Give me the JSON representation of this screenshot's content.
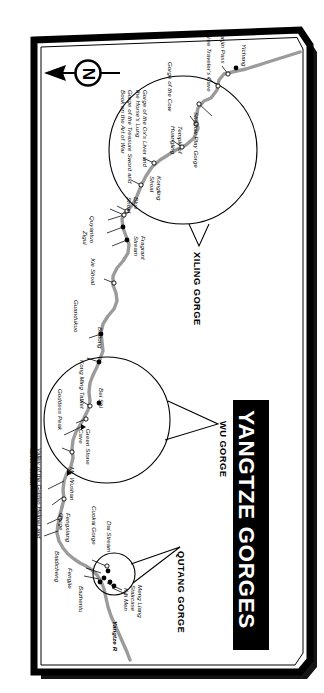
{
  "map": {
    "title": "YANGTZE GORGES",
    "river_label": "Yangtze R",
    "compass_label": "N",
    "colors": {
      "river": "#9b9b9b",
      "border": "#000000",
      "shadow": "#1a1a1a",
      "paper": "#ffffff",
      "banner": "#000000",
      "banner_text": "#ffffff"
    },
    "gorge_sections": [
      {
        "name": "XILING GORGE",
        "x": 196,
        "y": 240
      },
      {
        "name": "WU GORGE",
        "x": 222,
        "y": 412
      },
      {
        "name": "QUTANG GORGE",
        "x": 180,
        "y": 540
      }
    ],
    "places": [
      {
        "label": "Yichang",
        "marker": "filled"
      },
      {
        "label": "Nanjin Pass",
        "marker": "open"
      },
      {
        "label": "Three Traveler's Cave",
        "marker": "open"
      },
      {
        "label": "Shadow Play Gorge",
        "marker": "open"
      },
      {
        "label": "Gorge of the Cow",
        "marker": "open"
      },
      {
        "label": "Temple of Huangling",
        "marker": "open"
      },
      {
        "label": "Gorge of the Ox's Liver and the Horse's Lung",
        "marker": "open"
      },
      {
        "label": "Gorge of the Treasure Sword and Book on the Art of War",
        "marker": "open"
      },
      {
        "label": "Kongling Shoal",
        "marker": "open"
      },
      {
        "label": "Blue Shoal",
        "marker": "open"
      },
      {
        "label": "Fragrant Stream",
        "marker": "open"
      },
      {
        "label": "Quyantuo",
        "marker": "filled"
      },
      {
        "label": "Zigui",
        "marker": "filled"
      },
      {
        "label": "Xie Shoal",
        "marker": "open"
      },
      {
        "label": "Guandukuo",
        "marker": "filled"
      },
      {
        "label": "Badong",
        "marker": "filled"
      },
      {
        "label": "Kong Ming Tablet",
        "marker": "open"
      },
      {
        "label": "Bei Shi",
        "marker": "filled"
      },
      {
        "label": "Goddess Peak",
        "marker": "peak"
      },
      {
        "label": "Green Stone Cave",
        "marker": "open"
      },
      {
        "label": "Mt. Wushan",
        "marker": "peak"
      },
      {
        "label": "Valley of the Golden Helmet and Silver Armour",
        "marker": "open"
      },
      {
        "label": "Fengxiang Gorge",
        "marker": "open"
      },
      {
        "label": "Cuokai Gorge",
        "marker": "open"
      },
      {
        "label": "Dai Stream",
        "marker": "open"
      },
      {
        "label": "Baidicheng",
        "marker": "filled"
      },
      {
        "label": "Fengjie",
        "marker": "filled"
      },
      {
        "label": "Bazhentu",
        "marker": "filled"
      },
      {
        "label": "Kui Men",
        "marker": "filled"
      },
      {
        "label": "Meng Liang Staircase",
        "marker": "filled"
      }
    ]
  }
}
